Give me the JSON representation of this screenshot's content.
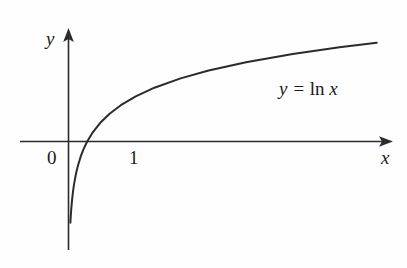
{
  "figure": {
    "background_color": "#fefefe",
    "ink_color": "#2b2b2b",
    "text_color": "#1a1a1a"
  },
  "labels": {
    "y_axis": "y",
    "x_axis": "x",
    "origin_tick": "0",
    "unit_tick": "1",
    "curve_equation_lhs": "y =",
    "curve_equation_fn": "ln",
    "curve_equation_arg": "x"
  },
  "chart_data": {
    "type": "line",
    "title": "",
    "subtitle": "",
    "xlabel": "x",
    "ylabel": "y",
    "legend": [],
    "legend_position": "none",
    "grid": false,
    "annotations": [
      {
        "text": "y = ln x",
        "x": 10.0,
        "y": 1.55
      },
      {
        "text": "0",
        "x": -0.35,
        "y": -0.32
      },
      {
        "text": "1",
        "x": 1.05,
        "y": -0.32
      }
    ],
    "axes": {
      "x_axis_drawn": true,
      "y_axis_drawn": true,
      "x_arrowhead": true,
      "y_arrowhead": true,
      "xlim": [
        -1.2,
        18.0
      ],
      "ylim": [
        -3.1,
        3.4
      ],
      "x_ticks": [
        0,
        1
      ],
      "x_tick_labels": [
        "0",
        "1"
      ],
      "y_ticks": [],
      "y_tick_labels": []
    },
    "series": [
      {
        "name": "y = ln x",
        "equation": "y = ln x",
        "color": "#2b2b2b",
        "x": [
          0.1,
          0.12,
          0.15,
          0.2,
          0.25,
          0.3,
          0.4,
          0.5,
          0.65,
          0.8,
          1.0,
          1.3,
          1.7,
          2.2,
          2.8,
          3.6,
          4.6,
          6.0,
          7.5,
          9.5,
          12.0,
          14.5,
          16.5
        ],
        "y": [
          -2.303,
          -2.12,
          -1.897,
          -1.609,
          -1.386,
          -1.204,
          -0.916,
          -0.693,
          -0.431,
          -0.223,
          0.0,
          0.262,
          0.531,
          0.788,
          1.03,
          1.281,
          1.526,
          1.792,
          2.015,
          2.251,
          2.485,
          2.674,
          2.803
        ]
      }
    ]
  }
}
